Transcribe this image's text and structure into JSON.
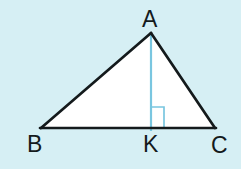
{
  "figure": {
    "kind": "geometry-diagram",
    "background_color": "#d6eff4",
    "interior_fill": "#ffffff",
    "stroke_color": "#141a1c",
    "altitude_color": "#79c6e0",
    "right_angle_color": "#79c6e0",
    "labels": {
      "apex": "A",
      "base_left": "B",
      "base_foot": "K",
      "base_right": "C"
    },
    "points": {
      "A": {
        "x": 151,
        "y": 33
      },
      "B": {
        "x": 41,
        "y": 128
      },
      "C": {
        "x": 215,
        "y": 128
      },
      "K": {
        "x": 151,
        "y": 129
      }
    },
    "segments": [
      {
        "name": "AB",
        "from": "A",
        "to": "B",
        "color": "#141a1c",
        "width": 2.6
      },
      {
        "name": "AC",
        "from": "A",
        "to": "C",
        "color": "#141a1c",
        "width": 2.6
      },
      {
        "name": "BC",
        "from": "B",
        "to": "C",
        "color": "#141a1c",
        "width": 2.6
      },
      {
        "name": "AK",
        "from": "A",
        "to": "K",
        "color": "#79c6e0",
        "width": 2.2
      }
    ],
    "right_angle_marker": {
      "at": "K",
      "side": "right",
      "size": 13,
      "color": "#79c6e0",
      "width": 1.6
    }
  }
}
